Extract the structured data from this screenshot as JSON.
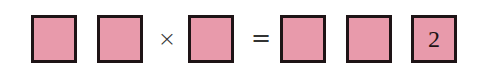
{
  "equation": {
    "boxes": [
      {
        "id": "box-1",
        "value": ""
      },
      {
        "id": "box-2",
        "value": ""
      },
      {
        "id": "box-3",
        "value": ""
      },
      {
        "id": "box-4",
        "value": ""
      },
      {
        "id": "box-5",
        "value": ""
      },
      {
        "id": "box-6",
        "value": "2"
      }
    ],
    "operators": {
      "times": "×",
      "equals": "="
    },
    "colors": {
      "box_fill": "#e89aab",
      "box_border": "#1e1416"
    }
  }
}
